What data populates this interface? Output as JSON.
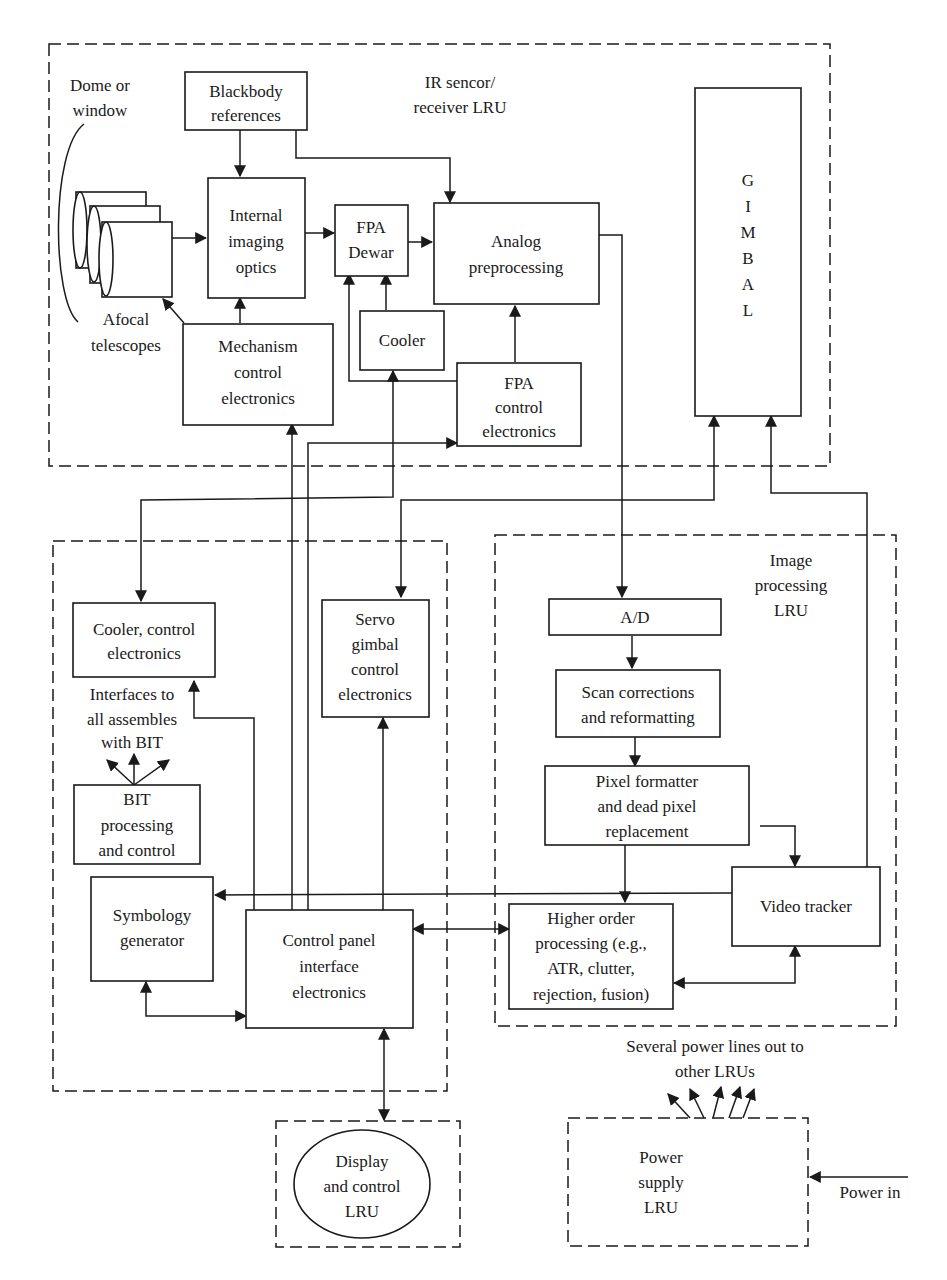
{
  "diagram": {
    "type": "block-diagram",
    "groups": {
      "ir_sensor": {
        "label_lines": [
          "IR sencor/",
          "receiver LRU"
        ]
      },
      "left_lru": {
        "label_lines": []
      },
      "image_processing": {
        "label_lines": [
          "Image",
          "processing",
          "LRU"
        ]
      },
      "display": {
        "label_lines": [
          "Display",
          "and control",
          "LRU"
        ]
      },
      "power_supply": {
        "label_lines": [
          "Power",
          "supply",
          "LRU"
        ]
      }
    },
    "blocks": {
      "blackbody": {
        "lines": [
          "Blackbody",
          "references"
        ]
      },
      "internal_optics": {
        "lines": [
          "Internal",
          "imaging",
          "optics"
        ]
      },
      "fpa_dewar": {
        "lines": [
          "FPA",
          "Dewar"
        ]
      },
      "analog": {
        "lines": [
          "Analog",
          "preprocessing"
        ]
      },
      "gimbal": {
        "lines": [
          "G",
          "I",
          "M",
          "B",
          "A",
          "L"
        ]
      },
      "cooler": {
        "lines": [
          "Cooler"
        ]
      },
      "mechanism": {
        "lines": [
          "Mechanism",
          "control",
          "electronics"
        ]
      },
      "fpa_control": {
        "lines": [
          "FPA",
          "control",
          "electronics"
        ]
      },
      "cooler_control": {
        "lines": [
          "Cooler, control",
          "electronics"
        ]
      },
      "servo": {
        "lines": [
          "Servo",
          "gimbal",
          "control",
          "electronics"
        ]
      },
      "bit": {
        "lines": [
          "BIT",
          "processing",
          "and control"
        ]
      },
      "symbology": {
        "lines": [
          "Symbology",
          "generator"
        ]
      },
      "control_panel": {
        "lines": [
          "Control panel",
          "interface",
          "electronics"
        ]
      },
      "ad": {
        "lines": [
          "A/D"
        ]
      },
      "scan": {
        "lines": [
          "Scan corrections",
          "and reformatting"
        ]
      },
      "pixel": {
        "lines": [
          "Pixel formatter",
          "and dead pixel",
          "replacement"
        ]
      },
      "video_tracker": {
        "lines": [
          "Video tracker"
        ]
      },
      "higher_order": {
        "lines": [
          "Higher order",
          "processing (e.g.,",
          "ATR, clutter,",
          "rejection, fusion)"
        ]
      }
    },
    "annotations": {
      "dome": {
        "lines": [
          "Dome or",
          "window"
        ]
      },
      "afocal": {
        "lines": [
          "Afocal",
          "telescopes"
        ]
      },
      "interfaces": {
        "lines": [
          "Interfaces to",
          "all assembles",
          "with BIT"
        ]
      },
      "power_lines": {
        "lines": [
          "Several power lines out to",
          "other LRUs"
        ]
      },
      "power_in": {
        "lines": [
          "Power in"
        ]
      }
    }
  }
}
